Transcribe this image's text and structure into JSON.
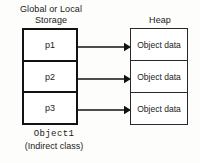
{
  "diagram": {
    "background_color": "#fdfdfb",
    "stroke_color": "#121212",
    "columns": {
      "left_label": "Global or Local\nStorage",
      "right_label": "Heap"
    },
    "stack_box": {
      "name": "Global or Local Storage block",
      "cells": [
        {
          "label": "p1"
        },
        {
          "label": "p2"
        },
        {
          "label": "p3"
        }
      ]
    },
    "heap_box": {
      "name": "Heap block",
      "cells": [
        {
          "label": "Object data"
        },
        {
          "label": "Object data"
        },
        {
          "label": "Object data"
        }
      ]
    },
    "arrows": [
      {
        "name": "pointer-arrow-p1",
        "from": "p1",
        "to": "Object data"
      },
      {
        "name": "pointer-arrow-p2",
        "from": "p2",
        "to": "Object data"
      },
      {
        "name": "pointer-arrow-p3",
        "from": "p3",
        "to": "Object data"
      }
    ],
    "caption": {
      "object_name": "Object1",
      "class_kind": "(Indirect class)"
    }
  }
}
